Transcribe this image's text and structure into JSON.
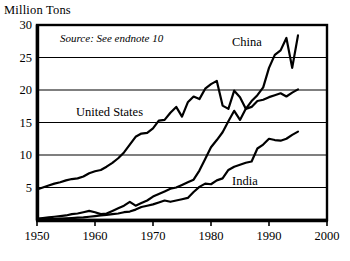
{
  "chart_data": {
    "type": "line",
    "title": "Million Tons",
    "ylabel": "Million Tons",
    "xlabel": "",
    "annotation": "Source: See endnote 10",
    "grid": true,
    "legend_position": "inline-labels",
    "xlim": [
      1950,
      2000
    ],
    "ylim": [
      0,
      30
    ],
    "xticks": [
      1950,
      1960,
      1970,
      1980,
      1990,
      2000
    ],
    "xtick_labels": [
      "1950",
      "1960",
      "1970",
      "1980",
      "1990",
      "2000"
    ],
    "yticks": [
      5,
      10,
      15,
      20,
      25,
      30
    ],
    "ytick_labels": [
      "5",
      "10",
      "15",
      "20",
      "25",
      "30"
    ],
    "series": [
      {
        "name": "China",
        "label": "China",
        "x": [
          1950,
          1951,
          1952,
          1953,
          1954,
          1955,
          1956,
          1957,
          1958,
          1959,
          1960,
          1961,
          1962,
          1963,
          1964,
          1965,
          1966,
          1967,
          1968,
          1969,
          1970,
          1971,
          1972,
          1973,
          1974,
          1975,
          1976,
          1977,
          1978,
          1979,
          1980,
          1981,
          1982,
          1983,
          1984,
          1985,
          1986,
          1987,
          1988,
          1989,
          1990,
          1991,
          1992,
          1993,
          1994,
          1995
        ],
        "values": [
          0.2,
          0.3,
          0.4,
          0.5,
          0.6,
          0.7,
          0.9,
          1.0,
          1.2,
          1.4,
          1.2,
          0.9,
          1.0,
          1.4,
          1.8,
          2.2,
          2.8,
          2.2,
          2.6,
          3.0,
          3.6,
          4.0,
          4.4,
          4.8,
          5.0,
          5.4,
          5.8,
          6.2,
          7.6,
          9.4,
          11.2,
          12.3,
          13.5,
          15.2,
          16.8,
          15.4,
          17.1,
          18.3,
          19.2,
          20.4,
          23.4,
          25.4,
          26.1,
          28.0,
          23.4,
          28.4
        ],
        "color": "#000000"
      },
      {
        "name": "United States",
        "label": "United States",
        "x": [
          1950,
          1951,
          1952,
          1953,
          1954,
          1955,
          1956,
          1957,
          1958,
          1959,
          1960,
          1961,
          1962,
          1963,
          1964,
          1965,
          1966,
          1967,
          1968,
          1969,
          1970,
          1971,
          1972,
          1973,
          1974,
          1975,
          1976,
          1977,
          1978,
          1979,
          1980,
          1981,
          1982,
          1983,
          1984,
          1985,
          1986,
          1987,
          1988,
          1989,
          1990,
          1991,
          1992,
          1993,
          1994,
          1995
        ],
        "values": [
          4.7,
          5.0,
          5.3,
          5.6,
          5.8,
          6.1,
          6.3,
          6.4,
          6.7,
          7.2,
          7.5,
          7.7,
          8.2,
          8.8,
          9.5,
          10.4,
          11.6,
          12.8,
          13.3,
          13.4,
          14.1,
          15.3,
          15.4,
          16.5,
          17.4,
          15.9,
          18.1,
          19.0,
          18.6,
          20.2,
          20.9,
          21.4,
          17.6,
          17.1,
          19.9,
          18.9,
          17.1,
          17.4,
          18.3,
          18.5,
          18.9,
          19.2,
          19.5,
          19.0,
          19.6,
          20.1
        ],
        "color": "#000000"
      },
      {
        "name": "India",
        "label": "India",
        "x": [
          1950,
          1951,
          1952,
          1953,
          1954,
          1955,
          1956,
          1957,
          1958,
          1959,
          1960,
          1961,
          1962,
          1963,
          1964,
          1965,
          1966,
          1967,
          1968,
          1969,
          1970,
          1971,
          1972,
          1973,
          1974,
          1975,
          1976,
          1977,
          1978,
          1979,
          1980,
          1981,
          1982,
          1983,
          1984,
          1985,
          1986,
          1987,
          1988,
          1989,
          1990,
          1991,
          1992,
          1993,
          1994,
          1995
        ],
        "values": [
          0.07,
          0.1,
          0.12,
          0.15,
          0.2,
          0.25,
          0.3,
          0.35,
          0.4,
          0.5,
          0.6,
          0.7,
          0.8,
          0.9,
          1.0,
          1.2,
          1.3,
          1.6,
          2.0,
          2.2,
          2.4,
          2.7,
          3.0,
          2.8,
          3.0,
          3.2,
          3.4,
          4.3,
          5.1,
          5.6,
          5.5,
          6.1,
          6.4,
          7.7,
          8.2,
          8.5,
          8.8,
          9.0,
          11.0,
          11.6,
          12.5,
          12.3,
          12.2,
          12.5,
          13.1,
          13.6
        ],
        "color": "#000000"
      }
    ]
  },
  "axis": {
    "y_title": "Million Tons",
    "ytick_labels": [
      "30",
      "25",
      "20",
      "15",
      "10",
      "5"
    ],
    "xtick_labels": [
      "1950",
      "1960",
      "1970",
      "1980",
      "1990",
      "2000"
    ]
  },
  "labels": {
    "china": "China",
    "united_states": "United States",
    "india": "India",
    "source": "Source: See endnote 10"
  },
  "colors": {
    "line": "#000000",
    "grid": "#000000",
    "frame": "#000000",
    "background": "#ffffff"
  }
}
